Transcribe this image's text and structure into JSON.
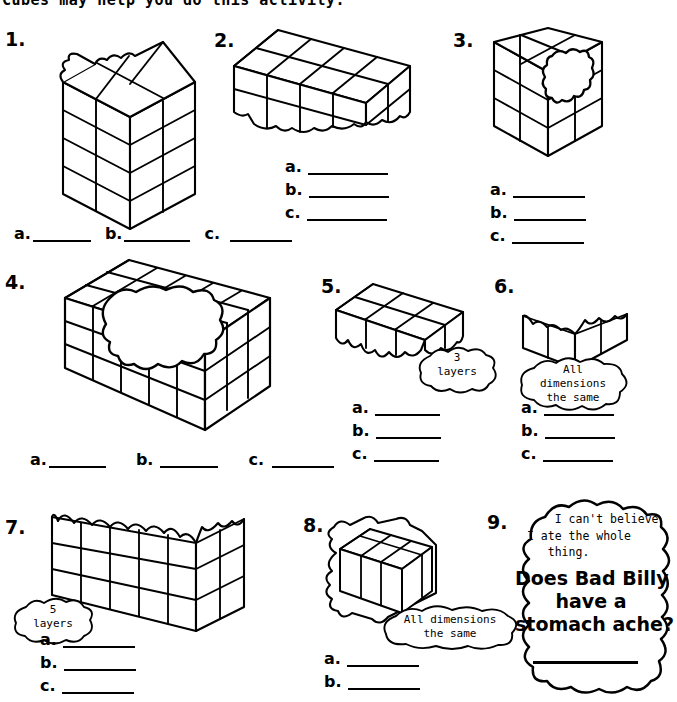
{
  "worksheet": {
    "header_text": "Cubes may help you do this activity.",
    "background_color": "#ffffff",
    "ink_color": "#000000"
  },
  "labels": {
    "a": "a.",
    "b": "b.",
    "c": "c."
  },
  "problems": [
    {
      "number": "1.",
      "figure": "tall-rectangular-prism-bitten-top-left",
      "blanks_layout": "horizontal",
      "blanks": [
        "a.",
        "b.",
        "c."
      ],
      "callout": null
    },
    {
      "number": "2.",
      "figure": "flat-rectangular-prism-bitten-front-bottom",
      "blanks_layout": "vertical",
      "blanks": [
        "a.",
        "b.",
        "c."
      ],
      "callout": null
    },
    {
      "number": "3.",
      "figure": "cube-with-blob-hole-front-face",
      "blanks_layout": "vertical",
      "blanks": [
        "a.",
        "b.",
        "c."
      ],
      "callout": null
    },
    {
      "number": "4.",
      "figure": "large-prism-big-blob-bite-on-top",
      "blanks_layout": "horizontal",
      "blanks": [
        "a.",
        "b.",
        "c."
      ],
      "callout": null
    },
    {
      "number": "5.",
      "figure": "prism-with-ragged-bottom-edge",
      "blanks_layout": "vertical",
      "blanks": [
        "a.",
        "b.",
        "c."
      ],
      "callout": {
        "line1": "3",
        "line2": "layers"
      }
    },
    {
      "number": "6.",
      "figure": "hollow-corner-two-walls-ragged-top",
      "blanks_layout": "vertical",
      "blanks": [
        "a.",
        "b.",
        "c."
      ],
      "callout": {
        "line1": "All",
        "line2": "dimensions",
        "line3": "the same"
      }
    },
    {
      "number": "7.",
      "figure": "long-corner-walls-ragged-top",
      "blanks_layout": "vertical",
      "blanks": [
        "a.",
        "b.",
        "c."
      ],
      "callout": {
        "line1": "5",
        "line2": "layers"
      }
    },
    {
      "number": "8.",
      "figure": "small-cube-ragged-all-over",
      "blanks_layout": "vertical",
      "blanks": [
        "a.",
        "b."
      ],
      "callout": {
        "line1": "All dimensions",
        "line2": "the same"
      }
    },
    {
      "number": "9.",
      "figure": "speech-blob",
      "blanks_layout": "single-line",
      "blanks": [],
      "callout": null,
      "quote_small": "    I can't believe\nI ate the whole\n   thing.",
      "quote_big": "Does Bad Billy\nhave a\nstomach ache?"
    }
  ]
}
